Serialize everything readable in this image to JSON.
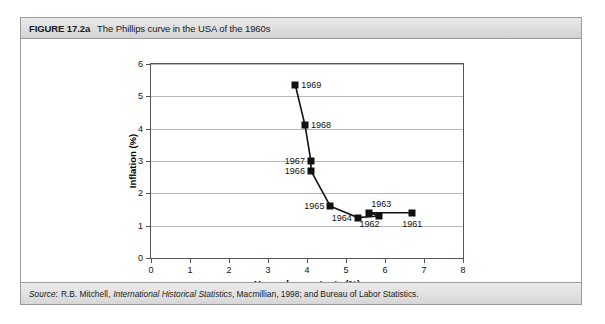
{
  "figure": {
    "number": "FIGURE 17.2a",
    "title": "The Phillips curve in the USA of the 1960s",
    "source_word": "Source",
    "source_sep": ":",
    "source_part1": "R.B. Mitchell,",
    "source_italic": "International Historical Statistics",
    "source_part2": ", Macmillian, 1998; and Bureau of Labor Statistics."
  },
  "chart_data": {
    "type": "scatter",
    "title": "The Phillips curve in the USA of the 1960s",
    "xlabel": "Unemployment rate (%)",
    "ylabel": "Inflation (%)",
    "xlim": [
      0,
      8
    ],
    "ylim": [
      0,
      6
    ],
    "xticks": [
      0,
      1,
      2,
      3,
      4,
      5,
      6,
      7,
      8
    ],
    "yticks": [
      0,
      1,
      2,
      3,
      4,
      5,
      6
    ],
    "grid": "horizontal",
    "legend": "none",
    "connected": true,
    "series_name": "Phillips curve 1961-1969",
    "points": [
      {
        "label": "1961",
        "x": 6.7,
        "y": 1.4,
        "label_pos": "below"
      },
      {
        "label": "1962",
        "x": 5.6,
        "y": 1.4,
        "label_pos": "below"
      },
      {
        "label": "1963",
        "x": 5.85,
        "y": 1.3,
        "label_pos": "above"
      },
      {
        "label": "1964",
        "x": 5.3,
        "y": 1.25,
        "label_pos": "left"
      },
      {
        "label": "1965",
        "x": 4.6,
        "y": 1.6,
        "label_pos": "left"
      },
      {
        "label": "1966",
        "x": 4.1,
        "y": 2.7,
        "label_pos": "left"
      },
      {
        "label": "1967",
        "x": 4.1,
        "y": 3.0,
        "label_pos": "left"
      },
      {
        "label": "1968",
        "x": 3.95,
        "y": 4.1,
        "label_pos": "right"
      },
      {
        "label": "1969",
        "x": 3.7,
        "y": 5.35,
        "label_pos": "right"
      }
    ],
    "line_order": [
      "1969",
      "1968",
      "1967",
      "1966",
      "1965",
      "1964",
      "1963",
      "1962",
      "1961"
    ],
    "colors": {
      "marker": "#111111",
      "line": "#111111",
      "grid": "#b8b8b8",
      "axis": "#555555"
    }
  }
}
